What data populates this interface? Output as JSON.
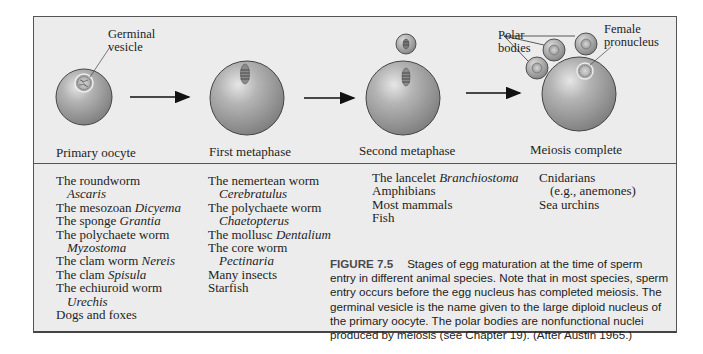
{
  "figure": {
    "stages": [
      {
        "label": "Primary oocyte"
      },
      {
        "label": "First metaphase"
      },
      {
        "label": "Second metaphase"
      },
      {
        "label": "Meiosis complete"
      }
    ],
    "annotations": {
      "germinal_vesicle": [
        "Germinal",
        "vesicle"
      ],
      "polar_bodies": [
        "Polar",
        "bodies"
      ],
      "female_pronucleus": [
        "Female",
        "pronucleus"
      ]
    },
    "colors": {
      "cell_fill": "#a8a8a8",
      "background": "#ececec",
      "border": "#555555"
    }
  },
  "species_columns": [
    {
      "items": [
        {
          "text": "The roundworm",
          "italic": ""
        },
        {
          "text": "",
          "italic": "Ascaris",
          "indent": true
        },
        {
          "text": "The mesozoan ",
          "italic": "Dicyema"
        },
        {
          "text": "The sponge ",
          "italic": "Grantia"
        },
        {
          "text": "The polychaete worm",
          "italic": ""
        },
        {
          "text": "",
          "italic": "Myzostoma",
          "indent": true
        },
        {
          "text": "The clam worm ",
          "italic": "Nereis"
        },
        {
          "text": "The clam ",
          "italic": "Spisula"
        },
        {
          "text": "The echiuroid worm",
          "italic": ""
        },
        {
          "text": "",
          "italic": "Urechis",
          "indent": true
        },
        {
          "text": "Dogs and foxes",
          "italic": ""
        }
      ]
    },
    {
      "items": [
        {
          "text": "The nemertean worm",
          "italic": ""
        },
        {
          "text": "",
          "italic": "Cerebratulus",
          "indent": true
        },
        {
          "text": "The polychaete worm",
          "italic": ""
        },
        {
          "text": "",
          "italic": "Chaetopterus",
          "indent": true
        },
        {
          "text": "The mollusc ",
          "italic": "Dentalium"
        },
        {
          "text": "The core worm",
          "italic": ""
        },
        {
          "text": "",
          "italic": "Pectinaria",
          "indent": true
        },
        {
          "text": "Many insects",
          "italic": ""
        },
        {
          "text": "Starfish",
          "italic": ""
        }
      ]
    },
    {
      "items": [
        {
          "text": "The lancelet ",
          "italic": "Branchiostoma"
        },
        {
          "text": "Amphibians",
          "italic": ""
        },
        {
          "text": "Most mammals",
          "italic": ""
        },
        {
          "text": "Fish",
          "italic": ""
        }
      ]
    },
    {
      "items": [
        {
          "text": "Cnidarians",
          "italic": ""
        },
        {
          "text": "(e.g., anemones)",
          "italic": "",
          "indent": true
        },
        {
          "text": "Sea urchins",
          "italic": ""
        }
      ]
    }
  ],
  "caption": {
    "figure_number": "FIGURE 7.5",
    "text": "Stages of egg maturation at the time of sperm entry in different animal species. Note that in most species, sperm entry occurs before the egg nucleus has completed meiosis. The germinal vesicle is the name given to the large diploid nucleus of the primary oocyte. The polar bodies are nonfunctional nuclei produced by meiosis (see Chapter 19). (After Austin 1965.)"
  }
}
